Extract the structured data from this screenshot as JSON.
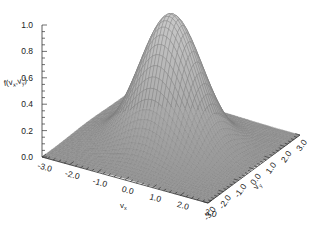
{
  "chart_data": {
    "type": "surface3d",
    "title": "",
    "function": "bivariate Gaussian f(v_x, v_y) = exp(-(v_x^2 + v_y^2)/2)",
    "xlabel": "v_x",
    "ylabel": "v_y",
    "zlabel": "f(v_x,v_y)",
    "xlim": [
      -3.0,
      3.0
    ],
    "ylim": [
      -3.0,
      3.0
    ],
    "zlim": [
      0.0,
      1.0
    ],
    "x_ticks": [
      "-3.0",
      "-2.0",
      "-1.0",
      "0.0",
      "1.0",
      "2.0",
      "3.0"
    ],
    "y_ticks": [
      "-3.0",
      "-2.0",
      "-1.0",
      "0.0",
      "1.0",
      "2.0",
      "3.0"
    ],
    "z_ticks": [
      "0.0",
      "0.2",
      "0.4",
      "0.6",
      "0.8",
      "1.0"
    ],
    "peak": {
      "x": 0.0,
      "y": 0.0,
      "z": 1.0
    },
    "grid": false,
    "legend": null,
    "render": "wireframe mesh, grey, on white background"
  },
  "labels": {
    "z_axis_title": "f(v",
    "z_axis_sub1": "x",
    "z_axis_mid": ",v",
    "z_axis_sub2": "y",
    "z_axis_end": ")",
    "x_axis_title": "v",
    "x_axis_sub": "x",
    "y_axis_title": "v",
    "y_axis_sub": "y"
  },
  "colors": {
    "mesh": "#8a8a8a",
    "mesh_light": "#c8c8c8",
    "axis": "#333333",
    "background": "#ffffff"
  }
}
